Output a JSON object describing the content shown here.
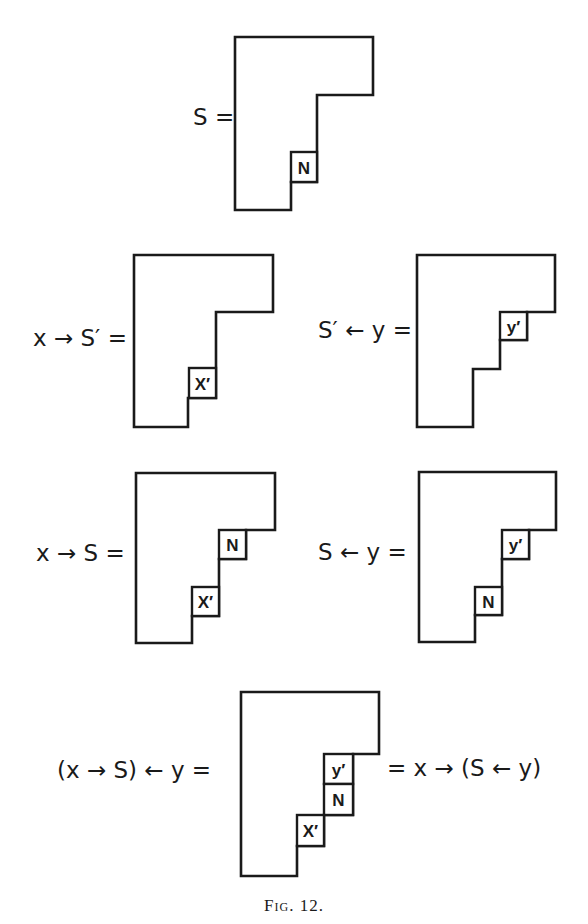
{
  "figure": {
    "caption": "Fig. 12.",
    "stroke_color": "#1a1a1a",
    "background": "#ffffff"
  },
  "diagrams": [
    {
      "id": "S",
      "label": "S =",
      "label_pos": [
        193,
        117
      ],
      "outline": [
        [
          235,
          37
        ],
        [
          373,
          37
        ],
        [
          373,
          95
        ],
        [
          317,
          95
        ],
        [
          317,
          182
        ],
        [
          291,
          182
        ],
        [
          291,
          210
        ],
        [
          235,
          210
        ]
      ],
      "cells": [
        {
          "text": "N",
          "x": 291,
          "y": 152,
          "w": 26,
          "h": 30
        }
      ]
    },
    {
      "id": "x-insert-S-prime",
      "label": "x → S′ =",
      "label_pos": [
        33,
        338
      ],
      "outline": [
        [
          134,
          255
        ],
        [
          273,
          255
        ],
        [
          273,
          312
        ],
        [
          216,
          312
        ],
        [
          216,
          398
        ],
        [
          188,
          398
        ],
        [
          188,
          427
        ],
        [
          134,
          427
        ]
      ],
      "cells": [
        {
          "text": "X′",
          "x": 189,
          "y": 368,
          "w": 27,
          "h": 30
        }
      ]
    },
    {
      "id": "S-prime-insert-y",
      "label": "S′ ← y =",
      "label_pos": [
        318,
        330
      ],
      "outline": [
        [
          417,
          255
        ],
        [
          555,
          255
        ],
        [
          555,
          312
        ],
        [
          527,
          312
        ],
        [
          527,
          340
        ],
        [
          500,
          340
        ],
        [
          500,
          369
        ],
        [
          473,
          369
        ],
        [
          473,
          427
        ],
        [
          417,
          427
        ]
      ],
      "cells": [
        {
          "text": "y′",
          "x": 500,
          "y": 312,
          "w": 27,
          "h": 28
        }
      ]
    },
    {
      "id": "x-insert-S",
      "label": "x → S =",
      "label_pos": [
        36,
        553
      ],
      "outline": [
        [
          136,
          473
        ],
        [
          275,
          473
        ],
        [
          275,
          530
        ],
        [
          246,
          530
        ],
        [
          246,
          559
        ],
        [
          219,
          559
        ],
        [
          219,
          616
        ],
        [
          192,
          616
        ],
        [
          192,
          643
        ],
        [
          136,
          643
        ]
      ],
      "cells": [
        {
          "text": "N",
          "x": 219,
          "y": 530,
          "w": 27,
          "h": 29
        },
        {
          "text": "X′",
          "x": 192,
          "y": 587,
          "w": 27,
          "h": 29
        }
      ]
    },
    {
      "id": "S-insert-y",
      "label": "S ← y =",
      "label_pos": [
        318,
        552
      ],
      "outline": [
        [
          419,
          472
        ],
        [
          556,
          472
        ],
        [
          556,
          530
        ],
        [
          529,
          530
        ],
        [
          529,
          559
        ],
        [
          502,
          559
        ],
        [
          502,
          615
        ],
        [
          475,
          615
        ],
        [
          475,
          642
        ],
        [
          419,
          642
        ]
      ],
      "cells": [
        {
          "text": "y′",
          "x": 502,
          "y": 530,
          "w": 27,
          "h": 29
        },
        {
          "text": "N",
          "x": 475,
          "y": 587,
          "w": 27,
          "h": 28
        }
      ]
    },
    {
      "id": "combined",
      "label": "(x → S) ← y =",
      "label_pos": [
        57,
        770
      ],
      "right_label": "= x → (S ← y)",
      "right_label_pos": [
        387,
        768
      ],
      "outline": [
        [
          241,
          692
        ],
        [
          379,
          692
        ],
        [
          379,
          754
        ],
        [
          353,
          754
        ],
        [
          353,
          815
        ],
        [
          324,
          815
        ],
        [
          324,
          846
        ],
        [
          297,
          846
        ],
        [
          297,
          876
        ],
        [
          241,
          876
        ]
      ],
      "cells": [
        {
          "text": "y′",
          "x": 324,
          "y": 754,
          "w": 29,
          "h": 30
        },
        {
          "text": "N",
          "x": 324,
          "y": 784,
          "w": 29,
          "h": 31
        },
        {
          "text": "X′",
          "x": 297,
          "y": 815,
          "w": 27,
          "h": 31
        }
      ]
    }
  ],
  "caption_pos": [
    294,
    905
  ]
}
